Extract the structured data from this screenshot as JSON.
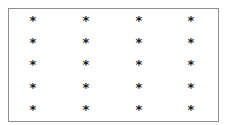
{
  "grid": {
    "symbol": "*",
    "rows": 5,
    "columns": 4,
    "column_x": [
      33,
      86,
      139,
      191
    ],
    "row_y": [
      19,
      41,
      63,
      86,
      108
    ],
    "cells": [
      [
        "*",
        "*",
        "*",
        "*"
      ],
      [
        "*",
        "*",
        "*",
        "*"
      ],
      [
        "*",
        "*",
        "*",
        "*"
      ],
      [
        "*",
        "*",
        "*",
        "*"
      ],
      [
        "*",
        "*",
        "*",
        "*"
      ]
    ]
  },
  "colors": {
    "border": "#8f8f8f",
    "symbol": "#1a1a1a",
    "background": "#ffffff"
  }
}
